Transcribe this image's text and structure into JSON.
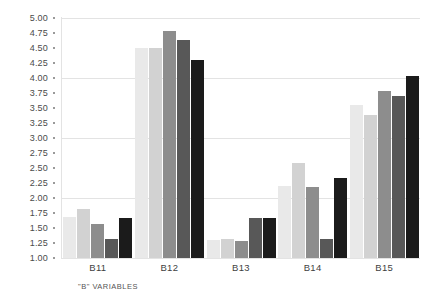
{
  "chart_data": {
    "type": "bar",
    "title": "",
    "subtitle": "",
    "xlabel": "\"B\" VARIABLES",
    "ylabel": "",
    "categories": [
      "B11",
      "B12",
      "B13",
      "B14",
      "B15"
    ],
    "ylim": [
      1.0,
      5.0
    ],
    "ytick_step": 0.25,
    "ytick_labels": [
      "5.00",
      "4.75",
      "4.50",
      "4.25",
      "4.00",
      "3.75",
      "3.50",
      "3.25",
      "3.00",
      "2.75",
      "2.50",
      "2.25",
      "2.00",
      "1.75",
      "1.50",
      "1.25",
      "1.00"
    ],
    "ytick_values": [
      5.0,
      4.75,
      4.5,
      4.25,
      4.0,
      3.75,
      3.5,
      3.25,
      3.0,
      2.75,
      2.5,
      2.25,
      2.0,
      1.75,
      1.5,
      1.25,
      1.0
    ],
    "gridlines_at": [
      5.0,
      4.0,
      3.0,
      2.0,
      1.0
    ],
    "grid": true,
    "legend": "none",
    "series": [
      {
        "name": "Series 1",
        "color": "#e9e9e9",
        "values": [
          1.68,
          4.5,
          1.3,
          2.2,
          3.55
        ]
      },
      {
        "name": "Series 2",
        "color": "#d2d2d2",
        "values": [
          1.82,
          4.5,
          1.32,
          2.58,
          3.38
        ]
      },
      {
        "name": "Series 3",
        "color": "#8d8d8d",
        "values": [
          1.57,
          4.78,
          1.28,
          2.18,
          3.78
        ]
      },
      {
        "name": "Series 4",
        "color": "#585858",
        "values": [
          1.32,
          4.63,
          1.67,
          1.32,
          3.7
        ]
      },
      {
        "name": "Series 5",
        "color": "#1b1b1b",
        "values": [
          1.67,
          4.3,
          1.67,
          2.33,
          4.03
        ]
      }
    ]
  }
}
